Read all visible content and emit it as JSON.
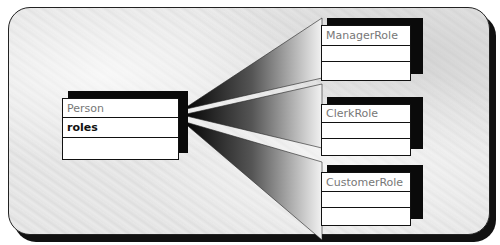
{
  "diagram": {
    "title": "",
    "classes": [
      {
        "id": "person",
        "name": "Person",
        "attributes": [
          "roles"
        ]
      },
      {
        "id": "manager",
        "name": "ManagerRole",
        "attributes": []
      },
      {
        "id": "clerk",
        "name": "ClerkRole",
        "attributes": []
      },
      {
        "id": "customer",
        "name": "CustomerRole",
        "attributes": []
      }
    ],
    "relationships": [
      {
        "from": "person.roles",
        "to": "manager",
        "style": "gradient-wedge"
      },
      {
        "from": "person.roles",
        "to": "clerk",
        "style": "gradient-wedge"
      },
      {
        "from": "person.roles",
        "to": "customer",
        "style": "gradient-wedge"
      }
    ],
    "colors": {
      "frame_bg": "#e3e3e3",
      "shadow": "#111111",
      "box_bg": "#ffffff",
      "wedge_dark": "#000000",
      "wedge_light": "#f2f2f2"
    }
  }
}
